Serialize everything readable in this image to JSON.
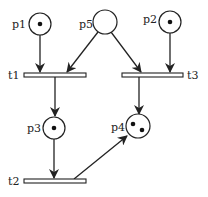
{
  "diagram": {
    "type": "petri-net",
    "places": [
      {
        "id": "p1",
        "label": "p1",
        "tokens": 1
      },
      {
        "id": "p2",
        "label": "p2",
        "tokens": 1
      },
      {
        "id": "p3",
        "label": "p3",
        "tokens": 1
      },
      {
        "id": "p4",
        "label": "p4",
        "tokens": 2
      },
      {
        "id": "p5",
        "label": "p5",
        "tokens": 0
      }
    ],
    "transitions": [
      {
        "id": "t1",
        "label": "t1"
      },
      {
        "id": "t2",
        "label": "t2"
      },
      {
        "id": "t3",
        "label": "t3"
      }
    ],
    "arcs": [
      {
        "from": "p1",
        "to": "t1"
      },
      {
        "from": "p5",
        "to": "t1"
      },
      {
        "from": "p5",
        "to": "t3"
      },
      {
        "from": "p2",
        "to": "t3"
      },
      {
        "from": "t1",
        "to": "p3"
      },
      {
        "from": "t3",
        "to": "p4"
      },
      {
        "from": "p3",
        "to": "t2"
      },
      {
        "from": "t2",
        "to": "p4"
      }
    ],
    "colors": {
      "stroke": "#222222",
      "fill": "#ffffff",
      "token": "#111111"
    }
  }
}
